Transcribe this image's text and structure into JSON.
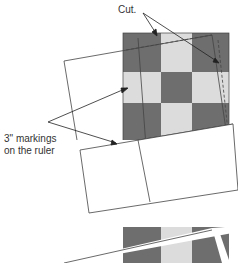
{
  "labels": {
    "cut": "Cut.",
    "markings_line1": "3\" markings",
    "markings_line2": "on the ruler"
  },
  "colors": {
    "dark": "#6e6e6e",
    "light": "#dcdcdc",
    "line": "#444444"
  }
}
